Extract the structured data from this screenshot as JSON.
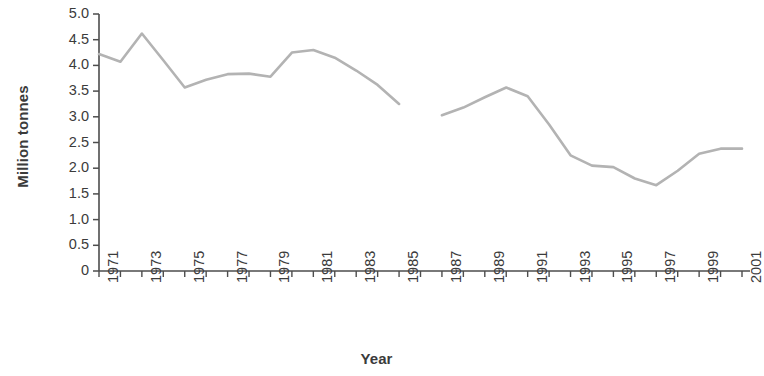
{
  "chart_data": {
    "type": "line",
    "title": "",
    "xlabel": "Year",
    "ylabel": "Million tonnes",
    "xlim": [
      1971,
      2001
    ],
    "ylim": [
      0,
      5.0
    ],
    "grid": false,
    "legend": false,
    "legend_position": "none",
    "line_color": "#b3b3b3",
    "axis_color": "#4d4d4d",
    "text_color": "#3b3b3b",
    "y_ticks": [
      "0",
      "0.5",
      "1.0",
      "1.5",
      "2.0",
      "2.5",
      "3.0",
      "3.5",
      "4.0",
      "4.5",
      "5.0"
    ],
    "y_tick_values": [
      0,
      0.5,
      1.0,
      1.5,
      2.0,
      2.5,
      3.0,
      3.5,
      4.0,
      4.5,
      5.0
    ],
    "x_ticks_all": [
      1971,
      1972,
      1973,
      1974,
      1975,
      1976,
      1977,
      1978,
      1979,
      1980,
      1981,
      1982,
      1983,
      1984,
      1985,
      1986,
      1987,
      1988,
      1989,
      1990,
      1991,
      1992,
      1993,
      1994,
      1995,
      1996,
      1997,
      1998,
      1999,
      2000,
      2001
    ],
    "x_tick_labels": [
      "1971",
      "1973",
      "1975",
      "1977",
      "1979",
      "1981",
      "1983",
      "1985",
      "1987",
      "1989",
      "1991",
      "1993",
      "1995",
      "1997",
      "1999",
      "2001"
    ],
    "x_tick_label_values": [
      1971,
      1973,
      1975,
      1977,
      1979,
      1981,
      1983,
      1985,
      1987,
      1989,
      1991,
      1993,
      1995,
      1997,
      1999,
      2001
    ],
    "gap_note": "series is broken between 1985 and 1987 (no value plotted for 1986)",
    "series": [
      {
        "name": "Million tonnes",
        "x": [
          1971,
          1972,
          1973,
          1974,
          1975,
          1976,
          1977,
          1978,
          1979,
          1980,
          1981,
          1982,
          1983,
          1984,
          1985
        ],
        "values": [
          4.22,
          4.07,
          4.62,
          4.1,
          3.57,
          3.72,
          3.83,
          3.84,
          3.78,
          4.25,
          4.3,
          4.15,
          3.9,
          3.62,
          3.25
        ]
      },
      {
        "name": "Million tonnes",
        "x": [
          1987,
          1988,
          1989,
          1990,
          1991,
          1992,
          1993,
          1994,
          1995,
          1996,
          1997,
          1998,
          1999,
          2000,
          2001
        ],
        "values": [
          3.03,
          3.18,
          3.38,
          3.57,
          3.4,
          2.85,
          2.25,
          2.05,
          2.02,
          1.8,
          1.67,
          1.95,
          2.28,
          2.38,
          2.38
        ]
      }
    ]
  }
}
